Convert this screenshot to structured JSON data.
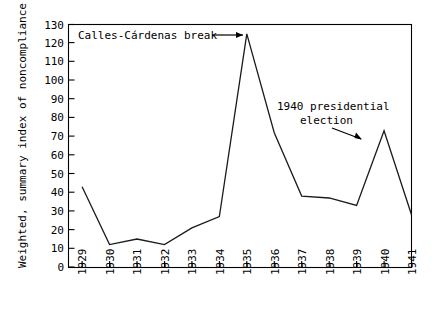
{
  "chart_data": {
    "type": "line",
    "title": "",
    "xlabel": "",
    "ylabel": "Weighted, summary index of noncompliance",
    "categories": [
      "1929",
      "1930",
      "1931",
      "1932",
      "1933",
      "1934",
      "1935",
      "1936",
      "1937",
      "1938",
      "1939",
      "1940",
      "1941"
    ],
    "values": [
      43,
      12,
      15,
      12,
      21,
      27,
      125,
      72,
      38,
      37,
      33,
      73,
      28
    ],
    "series": [
      {
        "name": "Weighted, summary index of noncompliance",
        "values": [
          43,
          12,
          15,
          12,
          21,
          27,
          125,
          72,
          38,
          37,
          33,
          73,
          28
        ]
      }
    ],
    "ylim": [
      0,
      130
    ],
    "ytick_labels": [
      "0",
      "10",
      "20",
      "30",
      "40",
      "50",
      "60",
      "70",
      "80",
      "90",
      "100",
      "110",
      "120",
      "130"
    ],
    "ytick_values": [
      0,
      10,
      20,
      30,
      40,
      50,
      60,
      70,
      80,
      90,
      100,
      110,
      120,
      130
    ],
    "xtick_labels": [
      "1929",
      "1930",
      "1931",
      "1932",
      "1933",
      "1934",
      "1935",
      "1936",
      "1937",
      "1938",
      "1939",
      "1940",
      "1941"
    ],
    "grid": false,
    "legend": false,
    "legend_position": "none",
    "line_color": "#1a1a1a",
    "annotations": [
      {
        "id": "calles-cardenas-break",
        "text": "Calles-Cárdenas break",
        "points_to_category": "1935",
        "points_to_value": 125
      },
      {
        "id": "presidential-election",
        "text_line_1": "1940 presidential",
        "text_line_2": "election",
        "points_to_category": "1940",
        "points_to_value": 73
      }
    ]
  },
  "figure": {
    "background_color": "#ffffff",
    "axis_color": "#000000"
  }
}
